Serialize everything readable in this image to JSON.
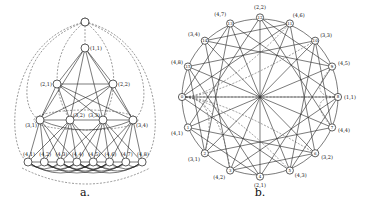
{
  "figure": {
    "panel_a": {
      "caption": "a.",
      "root": {
        "label": ""
      },
      "level1": [
        {
          "id": "1,1",
          "label": "(1,1)"
        }
      ],
      "level2": [
        {
          "id": "2,1",
          "label": "(2,1)"
        },
        {
          "id": "2,2",
          "label": "(2,2)"
        }
      ],
      "level3": [
        {
          "id": "3,1",
          "label": "(3,1)"
        },
        {
          "id": "3,2",
          "label": "(3,2)"
        },
        {
          "id": "3,3",
          "label": "(3,3)"
        },
        {
          "id": "3,4",
          "label": "(3,4)"
        }
      ],
      "level4": [
        {
          "id": "4,1",
          "label": "(4,1)"
        },
        {
          "id": "4,2",
          "label": "(4,2)"
        },
        {
          "id": "4,3",
          "label": "(4,3)"
        },
        {
          "id": "4,4",
          "label": "(4,4)"
        },
        {
          "id": "4,5",
          "label": "(4,5)"
        },
        {
          "id": "4,6",
          "label": "(4,6)"
        },
        {
          "id": "4,7",
          "label": "(4,7)"
        },
        {
          "id": "4,8",
          "label": "(4,8)"
        }
      ]
    },
    "panel_b": {
      "caption": "b.",
      "nodes": [
        {
          "num": "12",
          "label": "(2,2)"
        },
        {
          "num": "11",
          "label": "(4,6)"
        },
        {
          "num": "10",
          "label": "(3,3)"
        },
        {
          "num": "9",
          "label": "(4,5)"
        },
        {
          "num": "8",
          "label": "(1,1)"
        },
        {
          "num": "7",
          "label": "(4,4)"
        },
        {
          "num": "6",
          "label": "(3,2)"
        },
        {
          "num": "5",
          "label": "(4,3)"
        },
        {
          "num": "4",
          "label": "(2,1)"
        },
        {
          "num": "3",
          "label": "(4,2)"
        },
        {
          "num": "2",
          "label": "(3,1)"
        },
        {
          "num": "1",
          "label": "(4,1)"
        },
        {
          "num": "0",
          "label": ""
        },
        {
          "num": "15",
          "label": "(4,8)"
        },
        {
          "num": "14",
          "label": "(3,4)"
        },
        {
          "num": "13",
          "label": "(4,7)"
        }
      ]
    }
  }
}
